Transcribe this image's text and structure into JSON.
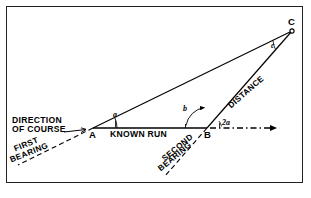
{
  "figure": {
    "title_present": false,
    "background_color": "#ffffff",
    "line_color": "#000000",
    "border_color": "#222222"
  },
  "vertices": {
    "a": "A",
    "b": "B",
    "c": "C"
  },
  "angles": {
    "at_a": "a",
    "at_b_interior": "b",
    "at_b_exterior": "2a",
    "at_c": "c"
  },
  "labels": {
    "direction_line1": "DIRECTION",
    "direction_line2": "OF COURSE",
    "known_run": "KNOWN RUN",
    "first_bearing_line1": "FIRST",
    "first_bearing_line2": "BEARING",
    "second_bearing_line1": "SECOND",
    "second_bearing_line2": "BEARING",
    "distance": "DISTANCE"
  },
  "geometry": {
    "point_a": [
      93,
      128
    ],
    "point_b": [
      207,
      128
    ],
    "point_c": [
      292,
      31
    ],
    "course_arrow_start": [
      244,
      128
    ],
    "course_arrow_end": [
      281,
      128
    ],
    "direction_arrow_start": [
      62,
      131
    ],
    "direction_arrow_end": [
      87,
      129
    ]
  }
}
